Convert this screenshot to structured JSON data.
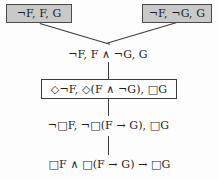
{
  "diagram": {
    "type": "modal-logic-proof-tree",
    "title": "",
    "orientation": "bottom-up",
    "background_color": "#fdfdfd",
    "line_color": "#3a3a3a",
    "shaded_fill": "#c9c9c9",
    "plain_fill": "#ffffff",
    "text_color": "#1b1b1b",
    "nodes": [
      {
        "id": "leaf-left",
        "label": "¬F, F, G",
        "style": "boxed-shaded",
        "row": 1,
        "note": "closed branch, top-left"
      },
      {
        "id": "leaf-right",
        "label": "¬F, ¬G, G",
        "style": "boxed-shaded",
        "row": 1,
        "note": "closed branch, top-right"
      },
      {
        "id": "row2",
        "label": "¬F, F ∧ ¬G, G",
        "style": "plain",
        "row": 2
      },
      {
        "id": "row3",
        "label": "◇¬F, ◇(F ∧ ¬G), □G",
        "style": "boxed-plain",
        "row": 3
      },
      {
        "id": "row4",
        "label": "¬□F, ¬□(F → G), □G",
        "style": "plain",
        "row": 4
      },
      {
        "id": "row5",
        "label": "□F ∧ □(F → G) → □G",
        "style": "plain",
        "row": 5,
        "note": "conclusion / K axiom"
      }
    ],
    "edges": [
      {
        "from": "row2",
        "to": "leaf-left",
        "kind": "diagonal"
      },
      {
        "from": "row2",
        "to": "leaf-right",
        "kind": "diagonal"
      },
      {
        "from": "row3",
        "to": "row2",
        "kind": "vertical"
      },
      {
        "from": "row4",
        "to": "row3",
        "kind": "vertical"
      },
      {
        "from": "row5",
        "to": "row4",
        "kind": "vertical"
      }
    ]
  }
}
